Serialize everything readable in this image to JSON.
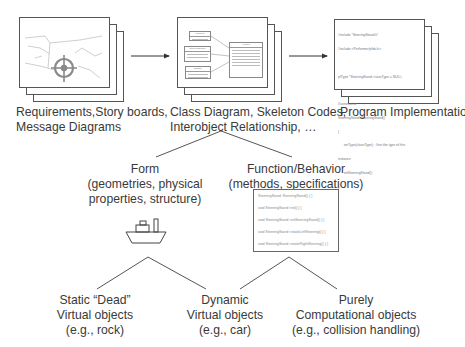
{
  "diagram": {
    "stages": [
      {
        "id": "requirements",
        "caption_lines": [
          "Requirements,Story boards,",
          "Message Diagrams"
        ],
        "thumbnail": "storyboard-sketch-with-steering-wheel"
      },
      {
        "id": "class-diagram",
        "caption_lines": [
          "Class Diagram, Skeleton Codes,",
          "Interobject Relationship, …"
        ],
        "thumbnail": "uml-class-diagram",
        "uml_classes": [
          "Camera",
          "SteeringStand",
          "Engine",
          "Vehicle"
        ]
      },
      {
        "id": "implementation",
        "caption_lines": [
          "Program Implementation"
        ],
        "thumbnail": "source-code",
        "code_lines": [
          "#include \"SteeringStand.h\"",
          "#include <Performer/pfdu.h>",
          "",
          "pfType *SteeringStand::classType = NULL;",
          "",
          "//constructor",
          "SteeringStand::SteeringStand()",
          "{",
          "      setType(classType);  //set the type of this",
          "instance",
          "      initSteeringStand();",
          "}"
        ]
      }
    ],
    "arrows": [
      {
        "from": "requirements",
        "to": "class-diagram"
      },
      {
        "from": "class-diagram",
        "to": "implementation"
      }
    ],
    "branches": {
      "form": {
        "title": "Form",
        "lines": [
          "(geometries, physical",
          "properties, structure)"
        ],
        "icon": "ship-icon"
      },
      "function": {
        "title": "Function/Behavior",
        "lines": [
          "(methods, specifications)"
        ],
        "methods": [
          "SteeringStand::SteeringStand() { }",
          "void SteeringStand::init() { }",
          "void SteeringStand::initSteeringStand() { }",
          "void SteeringStand::rotateLeftSteering() { }",
          "void SteeringStand::rotateRightSteering() { }"
        ]
      }
    },
    "leaves": [
      {
        "lines": [
          "Static “Dead”",
          "Virtual objects",
          "(e.g., rock)"
        ]
      },
      {
        "lines": [
          "Dynamic",
          "Virtual objects",
          "(e.g., car)"
        ]
      },
      {
        "lines": [
          "Purely",
          "Computational objects",
          "(e.g., collision handling)"
        ]
      }
    ],
    "colors": {
      "line": "#555555",
      "text": "#3a3a3a",
      "background": "#ffffff"
    }
  }
}
